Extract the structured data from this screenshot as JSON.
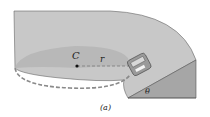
{
  "diagram": {
    "labels": {
      "center": "C",
      "radius": "r",
      "angle": "θ",
      "caption": "(a)"
    },
    "colors": {
      "road_surface": "#c9c9c9",
      "inner_disc": "#bdbdbd",
      "bank_side": "#a8a8a8",
      "edge": "#555555",
      "dashed": "#8a8a8a",
      "car": "#9a9a9a"
    }
  }
}
